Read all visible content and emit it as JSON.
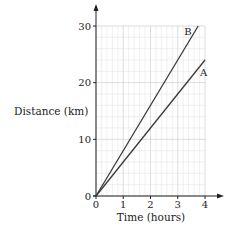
{
  "chart_data": {
    "type": "line",
    "title": "",
    "xlabel": "Time (hours)",
    "ylabel": "Distance (km)",
    "xlim": [
      0,
      4
    ],
    "ylim": [
      0,
      30
    ],
    "x_ticks": [
      "0",
      "1",
      "2",
      "3",
      "4"
    ],
    "y_ticks": [
      "0",
      "10",
      "20",
      "30"
    ],
    "grid": true,
    "grid_minor_x_step": 0.2,
    "grid_minor_y_step": 2,
    "series": [
      {
        "name": "A",
        "x": [
          0,
          4
        ],
        "y": [
          0,
          24
        ]
      },
      {
        "name": "B",
        "x": [
          0,
          3.75
        ],
        "y": [
          0,
          30
        ]
      }
    ],
    "colors": {
      "line": "#3a3a3a",
      "grid_minor": "#e6e6e6",
      "grid_major": "#c8c8c8",
      "axis": "#222222"
    }
  }
}
